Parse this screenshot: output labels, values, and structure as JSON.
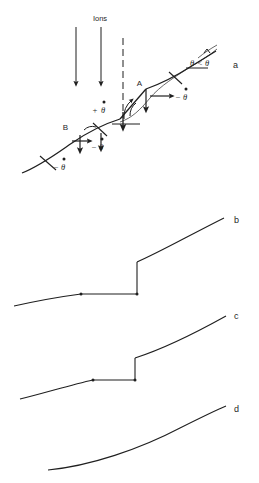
{
  "figure": {
    "background_color": "#ffffff",
    "line_color": "#1f1f1f",
    "panels": [
      {
        "id": "a",
        "label": "a",
        "label_x": 233,
        "label_y": 68,
        "description": "Schematic of an inclined surface bombarded by ions, showing a ledge at A and a ledge at B with local slope-change rates"
      },
      {
        "id": "b",
        "label": "b",
        "label_x": 234,
        "label_y": 223,
        "description": "Surface profile with a large vertical step discontinuity"
      },
      {
        "id": "c",
        "label": "c",
        "label_x": 234,
        "label_y": 319,
        "description": "Surface profile with a smaller vertical step discontinuity"
      },
      {
        "id": "d",
        "label": "d",
        "label_x": 234,
        "label_y": 412,
        "description": "Smooth surface profile with no discontinuity"
      }
    ],
    "panel_a": {
      "beam_label": "Ions",
      "beam_label_x": 100,
      "beam_label_y": 20,
      "ion_arrows": [
        {
          "x": 76,
          "y_start": 26,
          "y_end": 86
        },
        {
          "x": 101,
          "y_start": 26,
          "y_end": 86
        }
      ],
      "dashed_reference_line": {
        "x": 123,
        "y_start": 38,
        "y_end": 120
      },
      "points": [
        {
          "name": "A",
          "label": "A",
          "x": 146,
          "y": 89
        },
        {
          "name": "B",
          "label": "B",
          "x": 71,
          "y": 132
        }
      ],
      "annotations": [
        {
          "name": "angle-inequality",
          "text": "θ<θ",
          "accent": "hat",
          "x": 196,
          "y": 63
        },
        {
          "name": "theta-dot-positive",
          "text": "+θ",
          "accent": "dot",
          "x": 97,
          "y": 111
        },
        {
          "name": "theta-dot-negative-A",
          "text": "−θ",
          "accent": "dot",
          "x": 176,
          "y": 98
        },
        {
          "name": "theta-dot-negative-B",
          "text": "−θ",
          "accent": "dot",
          "x": 92,
          "y": 146
        },
        {
          "name": "theta-dot-negative-lower",
          "text": "−θ",
          "accent": "dot",
          "x": 55,
          "y": 166
        }
      ],
      "symbols": {
        "theta": "θ",
        "theta_hat": "θ̂",
        "theta_dot": "θ̇",
        "less_than": "<",
        "plus": "+",
        "minus": "−"
      }
    }
  },
  "profile_curves": {
    "b": {
      "has_step": true,
      "step_height": 40,
      "step_x": 137,
      "plateau_start_x": 81,
      "plateau_y": 294
    },
    "c": {
      "has_step": true,
      "step_height": 26,
      "step_x": 135,
      "plateau_start_x": 93,
      "plateau_y": 380
    },
    "d": {
      "has_step": false
    }
  }
}
